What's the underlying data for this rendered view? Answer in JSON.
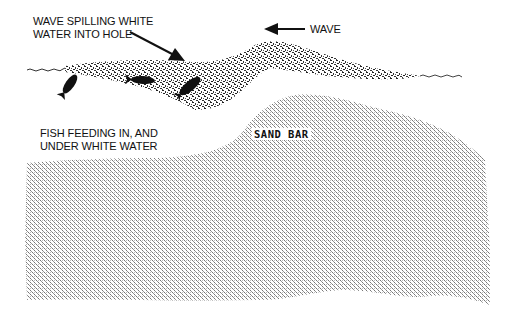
{
  "diagram": {
    "labels": {
      "spilling_line1": "WAVE SPILLING WHITE",
      "spilling_line2": "WATER INTO HOLE",
      "wave": "WAVE",
      "fish_line1": "FISH FEEDING IN, AND",
      "fish_line2": "UNDER WHITE WATER",
      "sand_bar": "SAND BAR"
    },
    "elements": {
      "arrows": [
        {
          "name": "spilling-arrow",
          "direction": "down-right"
        },
        {
          "name": "wave-direction-arrow",
          "direction": "left"
        }
      ],
      "fish_count": 3,
      "regions": [
        "white-water",
        "sand-bar",
        "hole"
      ]
    },
    "colors": {
      "ink": "#111111",
      "background": "#ffffff",
      "sand_stipple": "#8a8a8a"
    }
  }
}
